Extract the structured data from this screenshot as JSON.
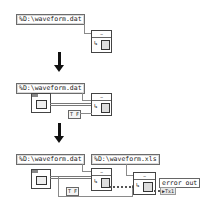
{
  "steps": [
    {
      "path_constant": "%D:\\waveform.dat",
      "read_node_label": "~",
      "read_node_icon": "read-file-icon"
    },
    {
      "path_constant": "%D:\\waveform.dat",
      "read_node_label": "~",
      "control_icon": "waveform-graph-icon",
      "bool_constant": "T F"
    },
    {
      "path_constant": "%D:\\waveform.dat",
      "path_constant_2": "%D:\\waveform.xls",
      "read_node_label": "~",
      "write_node_label": "~",
      "bool_constant": "T F",
      "error_out_label": "error out",
      "error_out_value": "▶Tx1"
    }
  ],
  "arrows": [
    "down-arrow",
    "down-arrow"
  ],
  "colors": {
    "wire": "#8a8a8a",
    "error_wire": "#555555",
    "arrow": "#111111"
  }
}
